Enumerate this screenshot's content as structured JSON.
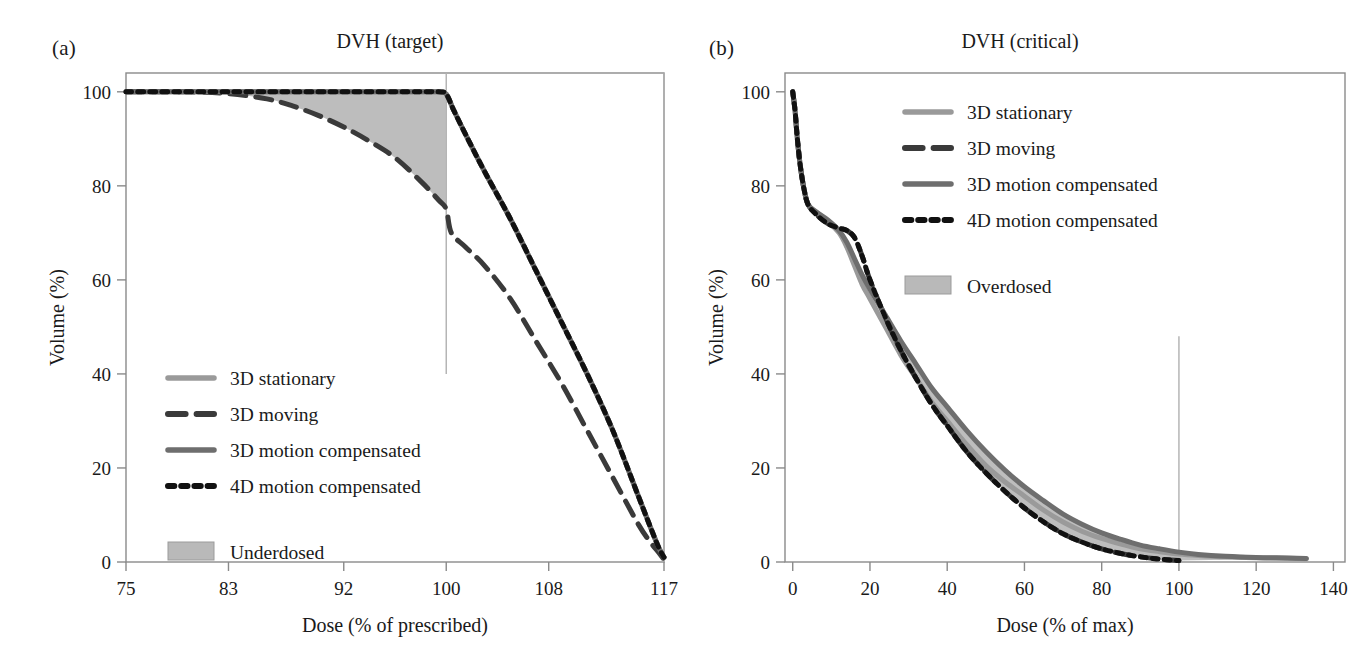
{
  "figure": {
    "background": "#ffffff",
    "panels": [
      {
        "key": "a",
        "label": "(a)",
        "title": "DVH (target)"
      },
      {
        "key": "b",
        "label": "(b)",
        "title": "DVH (critical)"
      }
    ]
  },
  "colors": {
    "stationary": "#9a9a9a",
    "moving": "#3a3a3a",
    "motion_compensated_3d": "#6e6e6e",
    "motion_compensated_4d": "#111111",
    "shade": "#b9b9b9",
    "axis": "#8a8a8a",
    "text": "#1a1a1a",
    "guide_line": "#b0b0b0"
  },
  "chart_data": [
    {
      "type": "line",
      "panel": "a",
      "panel_label": "(a)",
      "title": "DVH (target)",
      "xlabel": "Dose (% of prescribed)",
      "ylabel": "Volume (%)",
      "xlim": [
        75,
        117
      ],
      "ylim": [
        0,
        104
      ],
      "xticks": [
        75,
        83,
        92,
        100,
        108,
        117
      ],
      "xtick_labels": [
        "75",
        "83",
        "92",
        "100",
        "108",
        "117"
      ],
      "yticks": [
        0,
        20,
        40,
        60,
        80,
        100
      ],
      "ytick_labels": [
        "0",
        "20",
        "40",
        "60",
        "80",
        "100"
      ],
      "grid": false,
      "legend_position": "lower-left",
      "shaded_region": {
        "name": "Underdosed",
        "between": [
          "3D moving",
          "3D motion compensated"
        ],
        "x_range": [
          75,
          100
        ]
      },
      "vertical_reference_lines": [
        {
          "x": 100,
          "y_from": 40,
          "y_to": 104
        },
        {
          "x": 117,
          "y_from": 0,
          "y_to": 104
        }
      ],
      "series": [
        {
          "name": "3D stationary",
          "style": "solid",
          "color": "#9a9a9a",
          "width": 5,
          "x": [
            75,
            83,
            92,
            97,
            99.4,
            100,
            100.6,
            101.5,
            103,
            105,
            107,
            109,
            111,
            113,
            115,
            116,
            116.6,
            117
          ],
          "y": [
            100,
            100,
            100,
            100,
            100,
            99.5,
            96,
            91,
            83,
            73,
            62,
            51,
            40,
            28,
            14,
            7,
            3,
            1
          ]
        },
        {
          "name": "3D moving",
          "style": "dashed",
          "color": "#3a3a3a",
          "width": 5,
          "x": [
            75,
            80,
            83,
            86,
            88,
            90,
            92,
            94,
            96,
            98,
            99.4,
            100,
            100.4,
            101.5,
            103,
            105,
            107,
            109,
            111,
            113,
            115,
            116,
            116.6,
            117
          ],
          "y": [
            100,
            100,
            99.6,
            98.5,
            97,
            95,
            92.5,
            89.5,
            86,
            81,
            77,
            75,
            70,
            67,
            63,
            56,
            47,
            38,
            28,
            18,
            8,
            4,
            2,
            0.5
          ]
        },
        {
          "name": "3D motion compensated",
          "style": "solid",
          "color": "#6e6e6e",
          "width": 5,
          "x": [
            75,
            83,
            92,
            97,
            99.4,
            100,
            100.6,
            101.5,
            103,
            105,
            107,
            109,
            111,
            113,
            115,
            116,
            116.6,
            117
          ],
          "y": [
            100,
            100,
            100,
            100,
            100,
            99.5,
            96,
            91,
            83,
            73,
            62,
            51,
            40,
            28,
            14,
            7,
            3,
            1
          ]
        },
        {
          "name": "4D motion compensated",
          "style": "dotted",
          "color": "#111111",
          "width": 5,
          "x": [
            75,
            83,
            92,
            97,
            99.4,
            100,
            100.6,
            101.5,
            103,
            105,
            107,
            109,
            111,
            113,
            115,
            116,
            116.6,
            117
          ],
          "y": [
            100,
            100,
            100,
            100,
            100,
            99.5,
            96,
            91,
            83,
            73,
            62,
            51,
            40,
            28,
            14,
            7,
            3,
            1
          ]
        }
      ],
      "legend_items": [
        {
          "label": "3D stationary",
          "style": "solid",
          "color": "#9a9a9a"
        },
        {
          "label": "3D moving",
          "style": "dashed",
          "color": "#3a3a3a"
        },
        {
          "label": "3D motion compensated",
          "style": "solid",
          "color": "#6e6e6e"
        },
        {
          "label": "4D motion compensated",
          "style": "dotted",
          "color": "#111111"
        },
        {
          "label": "Underdosed",
          "style": "patch",
          "color": "#b9b9b9"
        }
      ]
    },
    {
      "type": "line",
      "panel": "b",
      "panel_label": "(b)",
      "title": "DVH (critical)",
      "xlabel": "Dose (% of max)",
      "ylabel": "Volume (%)",
      "xlim": [
        -2,
        143
      ],
      "ylim": [
        0,
        104
      ],
      "xticks": [
        0,
        20,
        40,
        60,
        80,
        100,
        120,
        140
      ],
      "xtick_labels": [
        "0",
        "20",
        "40",
        "60",
        "80",
        "100",
        "120",
        "140"
      ],
      "yticks": [
        0,
        20,
        40,
        60,
        80,
        100
      ],
      "ytick_labels": [
        "0",
        "20",
        "40",
        "60",
        "80",
        "100"
      ],
      "grid": false,
      "legend_position": "upper-right",
      "shaded_region": {
        "name": "Overdosed",
        "between": [
          "4D motion compensated",
          "3D motion compensated"
        ],
        "x_range": [
          20,
          133
        ]
      },
      "vertical_reference_lines": [
        {
          "x": 100,
          "y_from": 0,
          "y_to": 48
        }
      ],
      "series": [
        {
          "name": "3D stationary",
          "style": "solid",
          "color": "#9a9a9a",
          "width": 5,
          "x": [
            0,
            0.6,
            1.2,
            2,
            3,
            4,
            6,
            9,
            12,
            14,
            16,
            18,
            20,
            24,
            28,
            32,
            36,
            40,
            45,
            50,
            55,
            60,
            65,
            70,
            75,
            80,
            85,
            90,
            95,
            100,
            105,
            112,
            120,
            128,
            133
          ],
          "y": [
            100,
            96,
            90,
            84,
            79,
            76,
            74.5,
            72.5,
            70,
            67,
            63,
            59,
            56,
            50,
            44,
            39,
            34,
            30,
            25,
            20.5,
            17,
            14,
            11,
            8.5,
            6.5,
            5,
            3.8,
            2.8,
            2.2,
            1.7,
            1.4,
            1.1,
            0.9,
            0.8,
            0.7
          ]
        },
        {
          "name": "3D moving",
          "style": "dashed",
          "color": "#3a3a3a",
          "width": 5,
          "x": [
            0,
            0.6,
            1.2,
            2,
            3,
            4,
            6,
            9,
            12,
            14,
            16,
            18,
            20,
            24,
            28,
            32,
            36,
            40,
            45,
            50,
            55,
            60,
            65,
            70,
            75,
            80,
            85,
            90,
            95,
            100
          ],
          "y": [
            100,
            96,
            90,
            84,
            79,
            76,
            74,
            72,
            71,
            70.5,
            69,
            65,
            60,
            52,
            45,
            39,
            33.5,
            29,
            23.5,
            19,
            15,
            11.5,
            8.5,
            6,
            4.2,
            2.8,
            1.8,
            1.1,
            0.6,
            0.3
          ]
        },
        {
          "name": "3D motion compensated",
          "style": "solid",
          "color": "#6e6e6e",
          "width": 5,
          "x": [
            0,
            0.6,
            1.2,
            2,
            3,
            4,
            6,
            9,
            12,
            14,
            16,
            18,
            20,
            24,
            28,
            32,
            36,
            40,
            45,
            50,
            55,
            60,
            65,
            70,
            75,
            80,
            85,
            90,
            95,
            100,
            105,
            112,
            120,
            128,
            133
          ],
          "y": [
            100,
            96,
            90,
            84,
            79,
            76,
            74.5,
            72.8,
            70.5,
            68,
            64.5,
            61,
            58,
            52.5,
            47,
            42,
            37,
            33,
            28,
            23.5,
            19.5,
            16,
            13,
            10.2,
            8,
            6.2,
            4.8,
            3.6,
            2.8,
            2.1,
            1.6,
            1.2,
            0.95,
            0.85,
            0.75
          ]
        },
        {
          "name": "4D motion compensated",
          "style": "dotted",
          "color": "#111111",
          "width": 5,
          "x": [
            0,
            0.6,
            1.2,
            2,
            3,
            4,
            6,
            9,
            12,
            14,
            16,
            18,
            20,
            24,
            28,
            32,
            36,
            40,
            45,
            50,
            55,
            60,
            65,
            70,
            75,
            80,
            85,
            90,
            95,
            100
          ],
          "y": [
            100,
            96,
            90,
            84,
            79,
            76,
            74,
            72,
            71,
            70.5,
            69,
            65,
            60,
            52,
            45,
            39,
            33.5,
            29,
            23.5,
            19,
            15,
            11.5,
            8.5,
            6,
            4.2,
            2.8,
            1.8,
            1.1,
            0.6,
            0.3
          ]
        }
      ],
      "legend_items": [
        {
          "label": "3D stationary",
          "style": "solid",
          "color": "#9a9a9a"
        },
        {
          "label": "3D moving",
          "style": "dashed",
          "color": "#3a3a3a"
        },
        {
          "label": "3D motion compensated",
          "style": "solid",
          "color": "#6e6e6e"
        },
        {
          "label": "4D motion compensated",
          "style": "dotted",
          "color": "#111111"
        },
        {
          "label": "Overdosed",
          "style": "patch",
          "color": "#b9b9b9"
        }
      ]
    }
  ]
}
